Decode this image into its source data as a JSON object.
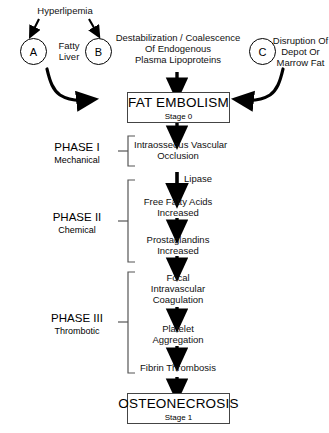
{
  "diagram": {
    "top_label": "Hyperlipemia",
    "etiology_nodes": [
      {
        "key": "A",
        "label": "Fatty\nLiver"
      },
      {
        "key": "B",
        "label": "Destabilization / Coalescence\nOf Endogenous\nPlasma Lipoproteins"
      },
      {
        "key": "C",
        "label": "Disruption Of\nDepot Or\nMarrow Fat"
      }
    ],
    "start_box": {
      "main": "FAT EMBOLISM",
      "sub": "Stage  0"
    },
    "end_box": {
      "main": "OSTEONECROSIS",
      "sub": "Stage 1"
    },
    "enzyme_label": "Lipase",
    "phases": [
      {
        "name": "PHASE I",
        "subtitle": "Mechanical",
        "steps": [
          "Intraosseous Vascular\nOcclusion"
        ]
      },
      {
        "name": "PHASE II",
        "subtitle": "Chemical",
        "steps": [
          "Free Fatty Acids\nIncreased",
          "Prostaglandins\nIncreased"
        ]
      },
      {
        "name": "PHASE III",
        "subtitle": "Thrombotic",
        "steps": [
          "Focal\nIntravascular\nCoagulation",
          "Platelet\nAggregation",
          "Fibrin Thrombosis"
        ]
      }
    ],
    "steps_flat": {
      "s1": "Intraosseous Vascular\nOcclusion",
      "s2": "Free Fatty Acids\nIncreased",
      "s3": "Prostaglandins\nIncreased",
      "s4": "Focal\nIntravascular\nCoagulation",
      "s5": "Platelet\nAggregation",
      "s6": "Fibrin Thrombosis"
    },
    "colors": {
      "line": "#000000",
      "box_border": "#444444",
      "background": "#ffffff",
      "text": "#111111"
    }
  }
}
